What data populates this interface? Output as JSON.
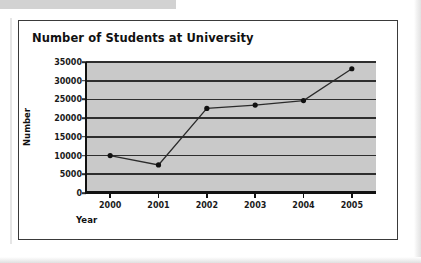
{
  "page": {
    "background_color": "#ffffff",
    "frame_color": "#3a3a3a",
    "scan_bar_color": "#d2d2d2"
  },
  "chart_data": {
    "type": "line",
    "title": "Number of Students at University",
    "xlabel": "Year",
    "ylabel": "Number",
    "categories": [
      "2000",
      "2001",
      "2002",
      "2003",
      "2004",
      "2005"
    ],
    "values": [
      10000,
      7500,
      22600,
      23500,
      24700,
      33200
    ],
    "ylim": [
      0,
      35000
    ],
    "ytick_labels": [
      "0",
      "5000",
      "10000",
      "15000",
      "20000",
      "25000",
      "30000",
      "35000"
    ],
    "ytick_values": [
      0,
      5000,
      10000,
      15000,
      20000,
      25000,
      30000,
      35000
    ],
    "grid": true,
    "legend": "none",
    "plot_background_color": "#c9c9c9",
    "line_color": "#2b2b2b",
    "marker_color": "#111111",
    "marker_shape": "circle"
  }
}
